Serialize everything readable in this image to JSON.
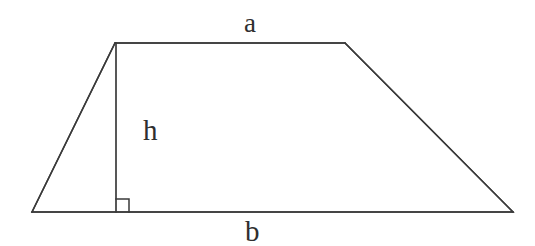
{
  "figure": {
    "kind": "geometry-diagram",
    "shape_name": "trapezoid",
    "background_color": "#ffffff",
    "stroke_color": "#3a3a3a",
    "label_color": "#2f2f2f",
    "canvas": {
      "width": 535,
      "height": 246
    }
  },
  "labels": {
    "top_side": "a",
    "height": "h",
    "bottom_side": "b"
  },
  "geometry": {
    "vertices": {
      "top_left": {
        "x": 115,
        "y": 43
      },
      "top_right": {
        "x": 345,
        "y": 43
      },
      "bottom_right": {
        "x": 513,
        "y": 212
      },
      "bottom_left": {
        "x": 32,
        "y": 212
      }
    },
    "height_segment": {
      "from": {
        "x": 116,
        "y": 43
      },
      "to": {
        "x": 116,
        "y": 212
      }
    },
    "right_angle_marker": {
      "x": 116,
      "y": 199,
      "size": 13
    },
    "stroke_width": 1.5
  },
  "icons": {
    "right_angle": "right-angle-icon"
  }
}
